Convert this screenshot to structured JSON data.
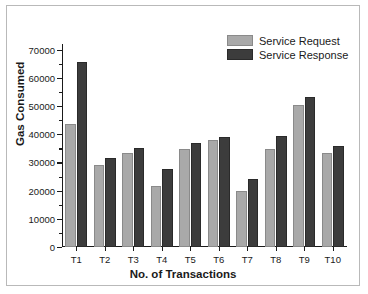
{
  "chart_data": {
    "type": "bar",
    "title": "",
    "xlabel": "No. of Transactions",
    "ylabel": "Gas Consumed",
    "categories": [
      "T1",
      "T2",
      "T3",
      "T4",
      "T5",
      "T6",
      "T7",
      "T8",
      "T9",
      "T10"
    ],
    "series": [
      {
        "name": "Service Request",
        "color": "#a9a9a9",
        "values": [
          43500,
          29000,
          33500,
          21800,
          34700,
          37800,
          20000,
          34700,
          50200,
          33300
        ]
      },
      {
        "name": "Service Response",
        "color": "#3c3c3c",
        "values": [
          65500,
          31500,
          35200,
          27500,
          36800,
          39100,
          24300,
          39200,
          53300,
          36000
        ]
      }
    ],
    "ylim": [
      0,
      72000
    ],
    "yticks": [
      0,
      10000,
      20000,
      30000,
      40000,
      50000,
      60000,
      70000
    ],
    "ytick_labels": [
      "0",
      "10000",
      "20000",
      "30000",
      "40000",
      "50000",
      "60000",
      "70000"
    ],
    "yminor_step": 5000,
    "grid": false,
    "legend_position": "top-right"
  },
  "legend": {
    "items": [
      {
        "label": "Service Request"
      },
      {
        "label": "Service Response"
      }
    ]
  }
}
